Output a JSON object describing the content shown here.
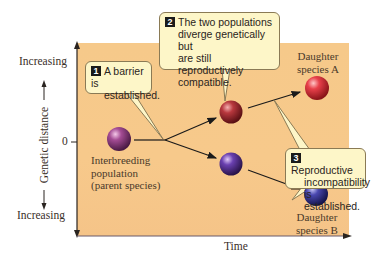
{
  "diagram": {
    "y_axis": {
      "label": "Genetic distance",
      "top_label": "Increasing",
      "bottom_label": "Increasing",
      "zero_label": "0"
    },
    "x_axis": {
      "label": "Time"
    },
    "nodes": {
      "parent": {
        "label_lines": [
          "Interbreeding",
          "population",
          "(parent species)"
        ],
        "color": "#8a3a7a"
      },
      "intermediate_upper": {
        "color": "#a8323a"
      },
      "intermediate_lower": {
        "color": "#5a3a9a"
      },
      "daughter_a": {
        "label_lines": [
          "Daughter",
          "species A"
        ],
        "color": "#d83a3a"
      },
      "daughter_b": {
        "label_lines": [
          "Daughter",
          "species B"
        ],
        "color": "#3a3a9a"
      }
    },
    "callouts": [
      {
        "number": "1",
        "lines": [
          "A barrier is",
          "established."
        ]
      },
      {
        "number": "2",
        "lines": [
          "The two populations",
          "diverge genetically but",
          "are still reproductively",
          "compatible."
        ]
      },
      {
        "number": "3",
        "lines": [
          "Reproductive",
          "incompatibility",
          "is established."
        ]
      }
    ],
    "colors": {
      "panel": "#f6c98a",
      "callout_bg": "#fdf6c8",
      "callout_border": "#8a7a55",
      "arrow": "#1a1a1a"
    }
  }
}
